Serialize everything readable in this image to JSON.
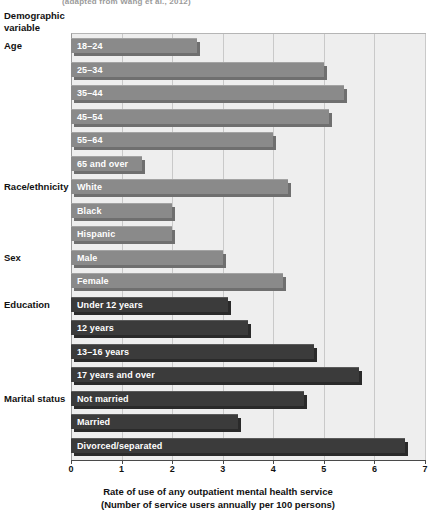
{
  "cutoff_citation": "(adapted from Wang et al., 2012)",
  "axis": {
    "y_heading_line1": "Demographic",
    "y_heading_line2": "variable",
    "x_title_line1": "Rate of use of any outpatient mental health service",
    "x_title_line2": "(Number of service users annually per 100 persons)",
    "x_ticks": [
      "0",
      "1",
      "2",
      "3",
      "4",
      "5",
      "6",
      "7"
    ]
  },
  "colors": {
    "bar_light": "#8a8a8a",
    "bar_dark": "#3b3b3b",
    "plot_background": "#eeeeee",
    "gridline": "#c9c9c9",
    "axis": "#4a4a4a",
    "bar_label_text": "#ffffff"
  },
  "groups": [
    {
      "label": "Age"
    },
    {
      "label": "Race/ethnicity"
    },
    {
      "label": "Sex"
    },
    {
      "label": "Education"
    },
    {
      "label": "Marital status"
    }
  ],
  "chart_data": {
    "type": "bar",
    "orientation": "horizontal",
    "title": "",
    "subtitle": "",
    "xlabel": "Rate of use of any outpatient mental health service (Number of service users annually per 100 persons)",
    "ylabel": "Demographic variable",
    "xlim": [
      0,
      7
    ],
    "xticks": [
      0,
      1,
      2,
      3,
      4,
      5,
      6,
      7
    ],
    "grid": true,
    "legend": "none",
    "groups": [
      "Age",
      "Race/ethnicity",
      "Sex",
      "Education",
      "Marital status"
    ],
    "categories": [
      "18–24",
      "25–34",
      "35–44",
      "45–54",
      "55–64",
      "65 and over",
      "White",
      "Black",
      "Hispanic",
      "Male",
      "Female",
      "Under 12 years",
      "12 years",
      "13–16 years",
      "17 years and over",
      "Not married",
      "Married",
      "Divorced/separated"
    ],
    "values": [
      2.5,
      5.0,
      5.4,
      5.1,
      4.0,
      1.4,
      4.3,
      2.0,
      2.0,
      3.0,
      4.2,
      3.1,
      3.5,
      4.8,
      5.7,
      4.6,
      3.3,
      6.6
    ],
    "bars": [
      {
        "group": "Age",
        "label": "18–24",
        "value": 2.5,
        "shade": "light"
      },
      {
        "group": "Age",
        "label": "25–34",
        "value": 5.0,
        "shade": "light"
      },
      {
        "group": "Age",
        "label": "35–44",
        "value": 5.4,
        "shade": "light"
      },
      {
        "group": "Age",
        "label": "45–54",
        "value": 5.1,
        "shade": "light"
      },
      {
        "group": "Age",
        "label": "55–64",
        "value": 4.0,
        "shade": "light"
      },
      {
        "group": "Age",
        "label": "65 and over",
        "value": 1.4,
        "shade": "light"
      },
      {
        "group": "Race/ethnicity",
        "label": "White",
        "value": 4.3,
        "shade": "light"
      },
      {
        "group": "Race/ethnicity",
        "label": "Black",
        "value": 2.0,
        "shade": "light"
      },
      {
        "group": "Race/ethnicity",
        "label": "Hispanic",
        "value": 2.0,
        "shade": "light"
      },
      {
        "group": "Sex",
        "label": "Male",
        "value": 3.0,
        "shade": "light"
      },
      {
        "group": "Sex",
        "label": "Female",
        "value": 4.2,
        "shade": "light"
      },
      {
        "group": "Education",
        "label": "Under 12 years",
        "value": 3.1,
        "shade": "dark"
      },
      {
        "group": "Education",
        "label": "12 years",
        "value": 3.5,
        "shade": "dark"
      },
      {
        "group": "Education",
        "label": "13–16 years",
        "value": 4.8,
        "shade": "dark"
      },
      {
        "group": "Education",
        "label": "17 years and over",
        "value": 5.7,
        "shade": "dark"
      },
      {
        "group": "Marital status",
        "label": "Not married",
        "value": 4.6,
        "shade": "dark"
      },
      {
        "group": "Marital status",
        "label": "Married",
        "value": 3.3,
        "shade": "dark"
      },
      {
        "group": "Marital status",
        "label": "Divorced/separated",
        "value": 6.6,
        "shade": "dark"
      }
    ]
  }
}
